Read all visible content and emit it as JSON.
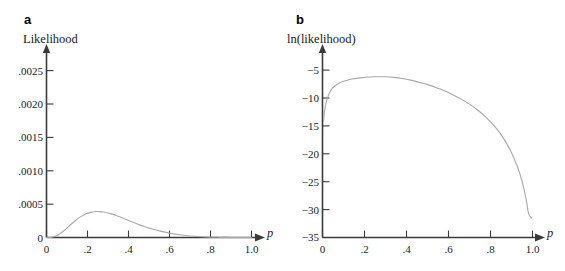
{
  "figure": {
    "background": "#ffffff",
    "curve_color": "#a8a8a8",
    "axis_color": "#3a3a3a"
  },
  "panels": [
    {
      "letter": "a",
      "ylabel": "Likelihood",
      "xlabel": "p",
      "origin_label": "0"
    },
    {
      "letter": "b",
      "ylabel": "ln(likelihood)",
      "xlabel": "p",
      "origin_label": "0"
    }
  ],
  "chart_data": [
    {
      "type": "line",
      "title": "a",
      "xlabel": "p",
      "ylabel": "Likelihood",
      "xlim": [
        0,
        1.05
      ],
      "ylim": [
        0,
        0.00275
      ],
      "grid": false,
      "legend": "none",
      "xticks": [
        0,
        0.2,
        0.4,
        0.6,
        0.8,
        1.0
      ],
      "xticklabels": [
        "0",
        ".2",
        ".4",
        ".6",
        ".8",
        "1.0"
      ],
      "yticks": [
        0,
        0.0005,
        0.001,
        0.0015,
        0.002,
        0.0025
      ],
      "yticklabels": [
        "0",
        ".0005",
        ".0010",
        ".0015",
        ".0020",
        ".0025"
      ],
      "series": [
        {
          "name": "binomial likelihood (n=20, x=6)",
          "x": [
            0.0,
            0.02,
            0.04,
            0.06,
            0.08,
            0.1,
            0.12,
            0.14,
            0.16,
            0.18,
            0.2,
            0.22,
            0.24,
            0.26,
            0.28,
            0.3,
            0.32,
            0.34,
            0.36,
            0.38,
            0.4,
            0.44,
            0.48,
            0.52,
            0.56,
            0.6,
            0.64,
            0.68,
            0.72,
            0.76,
            0.8,
            0.85,
            0.9,
            0.95,
            1.0
          ],
          "y": [
            0.0,
            2.3e-06,
            1.56e-05,
            4.5e-05,
            8.93e-05,
            0.0001425,
            0.0001982,
            0.000251,
            0.0002973,
            0.0003348,
            0.0003624,
            0.0003801,
            0.0003884,
            0.0003882,
            0.000381,
            0.0003678,
            0.0003501,
            0.000329,
            0.0003056,
            0.000281,
            0.0002559,
            0.0002069,
            0.0001622,
            0.0001236,
            9.16e-05,
            6.59e-05,
            4.58e-05,
            3.05e-05,
            1.92e-05,
            1.12e-05,
            5.9e-06,
            2.2e-06,
            6e-07,
            0.0,
            0.0
          ]
        }
      ],
      "peak": {
        "x": 0.3,
        "y": 0.0022
      }
    },
    {
      "type": "line",
      "title": "b",
      "xlabel": "p",
      "ylabel": "ln(likelihood)",
      "xlim": [
        0,
        1.05
      ],
      "ylim": [
        -35,
        -3
      ],
      "grid": false,
      "legend": "none",
      "xticks": [
        0,
        0.2,
        0.4,
        0.6,
        0.8,
        1.0
      ],
      "xticklabels": [
        "0",
        ".2",
        ".4",
        ".6",
        ".8",
        "1.0"
      ],
      "yticks": [
        -5,
        -10,
        -15,
        -20,
        -25,
        -30,
        -35
      ],
      "yticklabels": [
        "−5",
        "−10",
        "−15",
        "−20",
        "−25",
        "−30",
        "−35"
      ],
      "series": [
        {
          "name": "log binomial likelihood (n=20, x=6)",
          "x": [
            0.005,
            0.01,
            0.02,
            0.04,
            0.06,
            0.08,
            0.1,
            0.14,
            0.18,
            0.22,
            0.26,
            0.3,
            0.34,
            0.38,
            0.42,
            0.46,
            0.5,
            0.54,
            0.58,
            0.62,
            0.66,
            0.7,
            0.74,
            0.78,
            0.82,
            0.86,
            0.9,
            0.93,
            0.95,
            0.97,
            0.98,
            0.99,
            0.995
          ],
          "y": [
            -14.2,
            -12.3,
            -10.4,
            -8.6,
            -7.8,
            -7.3,
            -7.0,
            -6.6,
            -6.4,
            -6.25,
            -6.2,
            -6.2,
            -6.3,
            -6.5,
            -6.8,
            -7.2,
            -7.6,
            -8.1,
            -8.7,
            -9.4,
            -10.2,
            -11.1,
            -12.2,
            -13.5,
            -15.1,
            -17.1,
            -19.8,
            -22.5,
            -24.9,
            -28.2,
            -30.5,
            -31.3,
            -31.5
          ]
        }
      ],
      "peak": {
        "x": 0.3,
        "y": -6.2
      }
    }
  ]
}
